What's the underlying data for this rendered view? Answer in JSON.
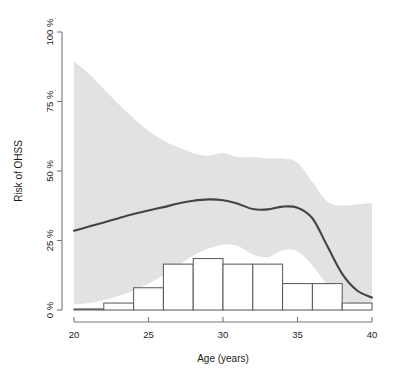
{
  "chart_data": {
    "type": "line",
    "title": "",
    "xlabel": "Age (years)",
    "ylabel": "Risk of OHSS",
    "xlim": [
      20,
      40
    ],
    "ylim": [
      0,
      100
    ],
    "grid": false,
    "legend": null,
    "x_ticks": [
      20,
      25,
      30,
      35,
      40
    ],
    "x_tick_labels": [
      "20",
      "25",
      "30",
      "35",
      "40"
    ],
    "y_ticks": [
      0,
      25,
      50,
      75,
      100
    ],
    "y_tick_labels": [
      "0 %",
      "25 %",
      "50 %",
      "75 %",
      "100 %"
    ],
    "series": [
      {
        "name": "Predicted risk of OHSS",
        "type": "line",
        "color": "#444444",
        "x": [
          20,
          21,
          22,
          23,
          24,
          25,
          26,
          27,
          28,
          29,
          30,
          31,
          32,
          33,
          34,
          35,
          36,
          37,
          38,
          39,
          40
        ],
        "values": [
          28.5,
          30.0,
          31.5,
          33.0,
          34.5,
          35.8,
          37.0,
          38.3,
          39.3,
          39.8,
          39.5,
          38.2,
          36.3,
          36.2,
          37.2,
          36.8,
          33.0,
          23.0,
          13.0,
          7.0,
          4.5
        ]
      },
      {
        "name": "Upper 95% confidence limit",
        "type": "band-upper",
        "color": "#e2e2e2",
        "x": [
          20,
          21,
          22,
          23,
          24,
          25,
          26,
          27,
          28,
          29,
          30,
          31,
          32,
          33,
          34,
          35,
          36,
          37,
          38,
          39,
          40
        ],
        "values": [
          89.5,
          85.0,
          79.5,
          74.0,
          69.0,
          64.5,
          61.0,
          58.5,
          56.5,
          55.5,
          56.5,
          55.0,
          55.0,
          54.5,
          54.5,
          53.0,
          46.0,
          39.0,
          37.5,
          38.0,
          38.5
        ]
      },
      {
        "name": "Lower 95% confidence limit",
        "type": "band-lower",
        "color": "#e2e2e2",
        "x": [
          20,
          21,
          22,
          23,
          24,
          25,
          26,
          27,
          28,
          29,
          30,
          31,
          32,
          33,
          34,
          35,
          36,
          37,
          38,
          39,
          40
        ],
        "values": [
          2.0,
          2.5,
          3.5,
          5.0,
          7.0,
          9.5,
          12.5,
          16.0,
          19.5,
          22.0,
          23.5,
          23.0,
          20.0,
          19.0,
          21.5,
          21.0,
          16.0,
          9.0,
          3.5,
          1.5,
          0.8
        ]
      }
    ],
    "histogram": {
      "name": "Age distribution of patients",
      "bin_edges": [
        20,
        22,
        24,
        26,
        28,
        30,
        32,
        34,
        36,
        38,
        40
      ],
      "bin_heights_pct": [
        0.4,
        2.5,
        8.0,
        16.5,
        18.5,
        16.5,
        16.5,
        9.5,
        9.5,
        2.5
      ],
      "fill": "#ffffff",
      "stroke": "#555555"
    },
    "annotations": []
  },
  "axes": {
    "y_axis_name": "risk-of-ohss-axis",
    "x_axis_name": "age-axis"
  }
}
